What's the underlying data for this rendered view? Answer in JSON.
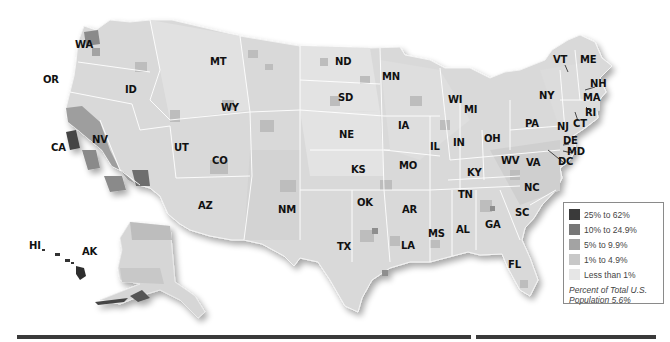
{
  "map": {
    "type": "choropleth",
    "region": "United States",
    "state_labels": [
      {
        "code": "WA",
        "x": 82,
        "y": 45
      },
      {
        "code": "OR",
        "x": 50,
        "y": 80
      },
      {
        "code": "CA",
        "x": 58,
        "y": 148
      },
      {
        "code": "NV",
        "x": 99,
        "y": 140
      },
      {
        "code": "ID",
        "x": 132,
        "y": 90
      },
      {
        "code": "MT",
        "x": 217,
        "y": 62
      },
      {
        "code": "WY",
        "x": 228,
        "y": 108
      },
      {
        "code": "UT",
        "x": 181,
        "y": 148
      },
      {
        "code": "CO",
        "x": 219,
        "y": 161
      },
      {
        "code": "AZ",
        "x": 205,
        "y": 206
      },
      {
        "code": "NM",
        "x": 285,
        "y": 210
      },
      {
        "code": "ND",
        "x": 342,
        "y": 62
      },
      {
        "code": "SD",
        "x": 345,
        "y": 98
      },
      {
        "code": "NE",
        "x": 346,
        "y": 135
      },
      {
        "code": "KS",
        "x": 358,
        "y": 170
      },
      {
        "code": "OK",
        "x": 364,
        "y": 203
      },
      {
        "code": "TX",
        "x": 344,
        "y": 247
      },
      {
        "code": "MN",
        "x": 389,
        "y": 77
      },
      {
        "code": "IA",
        "x": 405,
        "y": 126
      },
      {
        "code": "MO",
        "x": 406,
        "y": 166
      },
      {
        "code": "AR",
        "x": 409,
        "y": 210
      },
      {
        "code": "LA",
        "x": 408,
        "y": 246
      },
      {
        "code": "WI",
        "x": 455,
        "y": 100
      },
      {
        "code": "IL",
        "x": 437,
        "y": 147
      },
      {
        "code": "MI",
        "x": 471,
        "y": 110
      },
      {
        "code": "IN",
        "x": 460,
        "y": 143
      },
      {
        "code": "OH",
        "x": 491,
        "y": 139
      },
      {
        "code": "KY",
        "x": 474,
        "y": 173
      },
      {
        "code": "TN",
        "x": 465,
        "y": 195
      },
      {
        "code": "MS",
        "x": 435,
        "y": 234
      },
      {
        "code": "AL",
        "x": 463,
        "y": 230
      },
      {
        "code": "GA",
        "x": 492,
        "y": 225
      },
      {
        "code": "FL",
        "x": 515,
        "y": 265
      },
      {
        "code": "SC",
        "x": 522,
        "y": 213
      },
      {
        "code": "NC",
        "x": 531,
        "y": 188
      },
      {
        "code": "VA",
        "x": 533,
        "y": 163
      },
      {
        "code": "WV",
        "x": 508,
        "y": 161
      },
      {
        "code": "PA",
        "x": 532,
        "y": 124
      },
      {
        "code": "NY",
        "x": 546,
        "y": 96
      },
      {
        "code": "VT",
        "x": 560,
        "y": 60
      },
      {
        "code": "ME",
        "x": 587,
        "y": 60
      },
      {
        "code": "NH",
        "x": 597,
        "y": 84
      },
      {
        "code": "MA",
        "x": 590,
        "y": 98
      },
      {
        "code": "RI",
        "x": 592,
        "y": 113
      },
      {
        "code": "CT",
        "x": 580,
        "y": 124
      },
      {
        "code": "NJ",
        "x": 564,
        "y": 127
      },
      {
        "code": "DE",
        "x": 570,
        "y": 141
      },
      {
        "code": "MD",
        "x": 574,
        "y": 152
      },
      {
        "code": "DC",
        "x": 565,
        "y": 162
      },
      {
        "code": "HI",
        "x": 36,
        "y": 246
      },
      {
        "code": "AK",
        "x": 89,
        "y": 252
      }
    ]
  },
  "legend": {
    "items": [
      {
        "label": "25% to 62%",
        "color": "#3a3a3a"
      },
      {
        "label": "10% to 24.9%",
        "color": "#777777"
      },
      {
        "label": "5% to 9.9%",
        "color": "#a3a3a3"
      },
      {
        "label": "1% to 4.9%",
        "color": "#c8c8c8"
      },
      {
        "label": "Less than 1%",
        "color": "#e6e6e6"
      }
    ],
    "note": "Percent of Total U.S. Population 5.6%"
  },
  "colors": {
    "land_base": "#d9d9d9",
    "border": "#ffffff",
    "rule": "#3a3a3a"
  }
}
